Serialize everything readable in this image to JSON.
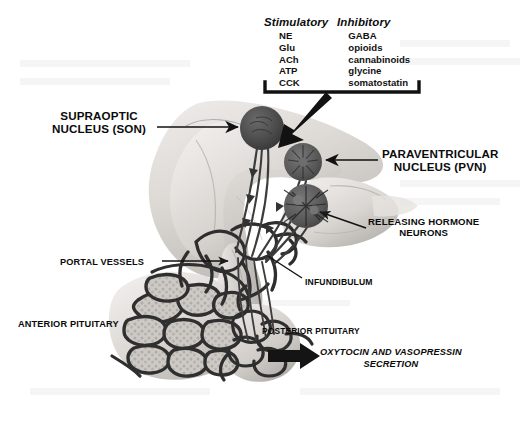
{
  "figure": {
    "background_color": "#ffffff"
  },
  "neurotransmitter_table": {
    "columns": [
      {
        "header": "Stimulatory",
        "items": [
          "NE",
          "Glu",
          "ACh",
          "ATP",
          "CCK"
        ]
      },
      {
        "header": "Inhibitory",
        "items": [
          "GABA",
          "opioids",
          "cannabinoids",
          "glycine",
          "somatostatin"
        ]
      }
    ]
  },
  "labels": {
    "supraoptic_nucleus": "SUPRAOPTIC\nNUCLEUS (SON)",
    "paraventricular_nucleus": "PARAVENTRICULAR\nNUCLEUS (PVN)",
    "releasing_hormone_neurons": "RELEASING HORMONE\nNEURONS",
    "portal_vessels": "PORTAL VESSELS",
    "infundibulum": "INFUNDIBULUM",
    "anterior_pituitary": "ANTERIOR PITUITARY",
    "posterior_pituitary": "POSTERIOR PITUITARY",
    "secretion": "OXYTOCIN AND VASOPRESSIN\nSECRETION"
  },
  "colors": {
    "brain_tissue_light": "#e4e1de",
    "brain_tissue_mid": "#cfcbc7",
    "brain_tissue_shadow": "#a8a4a0",
    "nucleus_dark": "#4c4c4c",
    "vessel_dark": "#2e2e2e",
    "text": "#0b0b0b",
    "arrow": "#111111"
  }
}
